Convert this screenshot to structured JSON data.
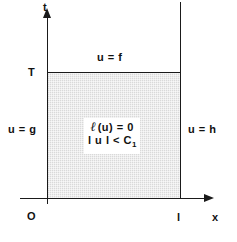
{
  "figure": {
    "axes": {
      "vertical_label": "t",
      "horizontal_label": "x",
      "origin_label": "O"
    },
    "ticks": {
      "t_tick": "T",
      "x_tick": "l"
    },
    "boundary_conditions": {
      "top": "u = f",
      "left": "u = g",
      "right": "u = h"
    },
    "interior": {
      "operator_symbol": "ℓ",
      "equation": "(u) = 0",
      "bound_prefix": "l u l < C",
      "bound_subscript": "1"
    },
    "colors": {
      "line": "#1a1a1a",
      "shading": "#d9d9d9",
      "text": "#111111",
      "background": "#ffffff"
    }
  }
}
